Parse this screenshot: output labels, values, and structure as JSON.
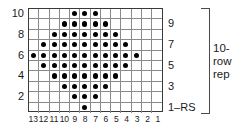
{
  "chart_data": {
    "type": "table",
    "xlabel": "stitch number",
    "ylabel": "row number",
    "grid": true,
    "columns": 13,
    "rows": 10,
    "column_labels": [
      "13",
      "12",
      "11",
      "10",
      "9",
      "8",
      "7",
      "6",
      "5",
      "4",
      "3",
      "2",
      "1"
    ],
    "column_order": "right-to-left",
    "row_labels_left": [
      "10",
      "8",
      "6",
      "4",
      "2"
    ],
    "row_labels_right": [
      "9",
      "7",
      "5",
      "3",
      "1–RS"
    ],
    "symbols": {
      "filled_dot": "purl-on-RS",
      "empty_cell": "knit-on-RS"
    },
    "legend_position": "right",
    "annotations": [
      "10-",
      "row",
      "rep"
    ],
    "colors": {
      "dot": "#000000",
      "gridline": "#8a8a8a",
      "border": "#3a3a3a",
      "background": "#ffffff",
      "text": "#1a1a1a"
    },
    "rows_data": [
      {
        "row": 10,
        "side": "WS",
        "label_side": "left",
        "label": "10",
        "filled_columns": [
          9,
          8,
          7
        ],
        "filled_count": 3
      },
      {
        "row": 9,
        "side": "RS",
        "label_side": "right",
        "label": "9",
        "filled_columns": [
          10,
          9,
          8,
          7,
          6
        ],
        "filled_count": 5
      },
      {
        "row": 8,
        "side": "WS",
        "label_side": "left",
        "label": "8",
        "filled_columns": [
          11,
          10,
          9,
          8,
          7,
          6,
          5
        ],
        "filled_count": 7
      },
      {
        "row": 7,
        "side": "RS",
        "label_side": "right",
        "label": "7",
        "filled_columns": [
          12,
          11,
          10,
          9,
          8,
          7,
          6,
          5,
          4
        ],
        "filled_count": 9
      },
      {
        "row": 6,
        "side": "WS",
        "label_side": "left",
        "label": "6",
        "filled_columns": [
          13,
          12,
          11,
          10,
          9,
          8,
          7,
          6,
          5,
          4,
          3
        ],
        "filled_count": 11
      },
      {
        "row": 5,
        "side": "RS",
        "label_side": "right",
        "label": "5",
        "filled_columns": [
          12,
          11,
          10,
          9,
          8,
          7,
          6,
          5,
          4
        ],
        "filled_count": 9
      },
      {
        "row": 4,
        "side": "WS",
        "label_side": "left",
        "label": "4",
        "filled_columns": [
          11,
          10,
          9,
          8,
          7,
          6,
          5
        ],
        "filled_count": 7
      },
      {
        "row": 3,
        "side": "RS",
        "label_side": "right",
        "label": "3",
        "filled_columns": [
          10,
          9,
          8,
          7,
          6
        ],
        "filled_count": 5
      },
      {
        "row": 2,
        "side": "WS",
        "label_side": "left",
        "label": "2",
        "filled_columns": [
          9,
          8,
          7
        ],
        "filled_count": 3
      },
      {
        "row": 1,
        "side": "RS",
        "label_side": "right",
        "label": "1–RS",
        "filled_columns": [
          8
        ],
        "filled_count": 1
      }
    ]
  },
  "row_labels_left": [
    {
      "text": "10",
      "row": 10
    },
    {
      "text": "8",
      "row": 8
    },
    {
      "text": "6",
      "row": 6
    },
    {
      "text": "4",
      "row": 4
    },
    {
      "text": "2",
      "row": 2
    }
  ],
  "row_labels_right": [
    {
      "text": "9",
      "row": 9
    },
    {
      "text": "7",
      "row": 7
    },
    {
      "text": "5",
      "row": 5
    },
    {
      "text": "3",
      "row": 3
    },
    {
      "text": "1–RS",
      "row": 1
    }
  ],
  "column_labels": [
    "13",
    "12",
    "11",
    "10",
    "9",
    "8",
    "7",
    "6",
    "5",
    "4",
    "3",
    "2",
    "1"
  ],
  "repeat": {
    "line1": "10-",
    "line2": "row",
    "line3": "rep"
  }
}
